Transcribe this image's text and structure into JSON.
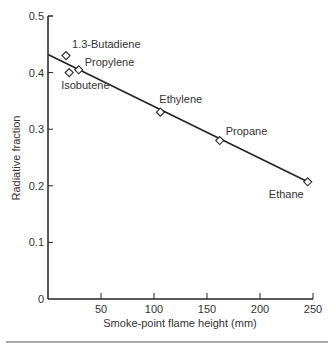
{
  "chart_data": {
    "type": "scatter",
    "title": "",
    "xlabel": "Smoke-point flame height (mm)",
    "ylabel": "Radiative fraction",
    "xlim": [
      0,
      250
    ],
    "ylim": [
      0,
      0.5
    ],
    "x_ticks": [
      "50",
      "100",
      "150",
      "200",
      "250"
    ],
    "y_ticks": [
      "0",
      "0.1",
      "0.2",
      "0.3",
      "0.4",
      "0.5"
    ],
    "grid": false,
    "legend": "none",
    "series": [
      {
        "name": "Fuels",
        "marker": "diamond",
        "points": [
          {
            "label": "1.3-Butadiene",
            "x": 17,
            "y": 0.43
          },
          {
            "label": "Isobutene",
            "x": 20,
            "y": 0.4
          },
          {
            "label": "Propylene",
            "x": 29,
            "y": 0.405
          },
          {
            "label": "Ethylene",
            "x": 106,
            "y": 0.33
          },
          {
            "label": "Propane",
            "x": 162,
            "y": 0.28
          },
          {
            "label": "Ethane",
            "x": 245,
            "y": 0.207
          }
        ]
      },
      {
        "name": "Linear fit",
        "type": "line",
        "x": [
          0,
          245
        ],
        "y": [
          0.432,
          0.207
        ]
      }
    ]
  }
}
